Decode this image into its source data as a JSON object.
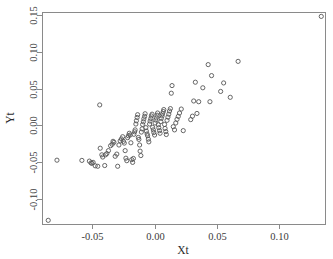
{
  "figure": {
    "width": 333,
    "height": 259,
    "background": "#ffffff",
    "point_color": "#565656",
    "axis_color": "#8a8a8a",
    "text_color": "#3b3b3b"
  },
  "plot_box": {
    "left": 42,
    "right": 325,
    "top": 12,
    "bottom": 224
  },
  "chart_data": {
    "type": "scatter",
    "title": "",
    "xlabel": "Xt",
    "ylabel": "Yt",
    "grid": false,
    "legend": null,
    "marker": "open-circle",
    "xlim": [
      -0.0905,
      0.1365
    ],
    "ylim": [
      -0.1345,
      0.1545
    ],
    "xticks": [
      -0.05,
      0.0,
      0.05,
      0.1
    ],
    "xticklabels": [
      "-0.05",
      "0.00",
      "0.05",
      "0.10"
    ],
    "yticks": [
      -0.1,
      -0.05,
      0.0,
      0.05,
      0.1,
      0.15
    ],
    "yticklabels": [
      "-0.10",
      "-0.05",
      "0.00",
      "0.05",
      "0.10",
      "0.15"
    ],
    "n_points": 124,
    "x": [
      0.1335,
      -0.0855,
      -0.0785,
      -0.0585,
      -0.0525,
      -0.0512,
      -0.0505,
      -0.0495,
      -0.0478,
      -0.0458,
      -0.0442,
      -0.0438,
      -0.0425,
      -0.0418,
      -0.0402,
      -0.0395,
      -0.0385,
      -0.0372,
      -0.0355,
      -0.0342,
      -0.0335,
      -0.0328,
      -0.0318,
      -0.0305,
      -0.0298,
      -0.0288,
      -0.0278,
      -0.0268,
      -0.0258,
      -0.0252,
      -0.0245,
      -0.0238,
      -0.0232,
      -0.0225,
      -0.0218,
      -0.0212,
      -0.0205,
      -0.0198,
      -0.0192,
      -0.0185,
      -0.0178,
      -0.0172,
      -0.0168,
      -0.0162,
      -0.0158,
      -0.0152,
      -0.0148,
      -0.0142,
      -0.0138,
      -0.0132,
      -0.0128,
      -0.0122,
      -0.0118,
      -0.0112,
      -0.0108,
      -0.0102,
      -0.0098,
      -0.0092,
      -0.0088,
      -0.0082,
      -0.0078,
      -0.0072,
      -0.0068,
      -0.0062,
      -0.0058,
      -0.0052,
      -0.0048,
      -0.0042,
      -0.0038,
      -0.0032,
      -0.0028,
      -0.0022,
      -0.0018,
      -0.0012,
      -0.0008,
      -0.0002,
      0.0002,
      0.0008,
      0.0012,
      0.0018,
      0.0022,
      0.0028,
      0.0032,
      0.0038,
      0.0042,
      0.0048,
      0.0052,
      0.0058,
      0.0062,
      0.0068,
      0.0072,
      0.0078,
      0.0082,
      0.0088,
      0.0092,
      0.0098,
      0.0105,
      0.0112,
      0.0118,
      0.0125,
      0.0132,
      0.0138,
      0.0148,
      0.0158,
      0.0168,
      0.0178,
      0.0188,
      0.0198,
      0.0212,
      0.0228,
      0.0288,
      0.0302,
      0.0312,
      0.0325,
      0.0338,
      0.0352,
      0.0385,
      0.0428,
      0.0442,
      0.0455,
      0.0528,
      0.0552,
      0.0605,
      0.0668
    ],
    "y": [
      0.1485,
      -0.1295,
      -0.0475,
      -0.0478,
      -0.0488,
      -0.0512,
      -0.0518,
      -0.0505,
      -0.0552,
      -0.0558,
      0.0278,
      -0.0312,
      -0.0402,
      -0.0432,
      -0.0548,
      -0.0402,
      -0.0385,
      -0.0345,
      -0.0278,
      -0.0258,
      -0.0218,
      -0.0232,
      -0.0422,
      -0.0392,
      -0.0558,
      -0.0268,
      -0.0212,
      -0.0185,
      -0.0155,
      -0.0218,
      -0.0242,
      -0.0345,
      -0.0448,
      -0.0482,
      -0.0168,
      -0.0142,
      -0.0108,
      -0.0132,
      -0.0238,
      -0.0468,
      -0.0505,
      -0.0452,
      -0.0122,
      -0.0088,
      -0.0062,
      0.0018,
      0.0062,
      0.0108,
      0.0145,
      -0.0165,
      -0.0192,
      -0.0268,
      -0.0352,
      -0.0412,
      -0.0092,
      -0.0048,
      0.0012,
      0.0048,
      0.0088,
      0.0122,
      0.0158,
      -0.0032,
      -0.0078,
      -0.0118,
      -0.0142,
      -0.0188,
      -0.0225,
      0.0018,
      0.0058,
      0.0092,
      0.0128,
      0.0152,
      -0.0028,
      -0.0062,
      -0.0098,
      -0.0132,
      0.0032,
      0.0072,
      0.0102,
      0.0138,
      0.0168,
      0.0008,
      -0.0032,
      -0.0072,
      -0.0108,
      0.0052,
      0.0095,
      0.0128,
      0.0158,
      0.0188,
      0.0215,
      0.0012,
      -0.0042,
      -0.0085,
      -0.0125,
      0.0068,
      0.0112,
      0.0152,
      0.0195,
      0.0228,
      0.0438,
      0.0542,
      -0.0018,
      -0.0062,
      0.0032,
      0.0082,
      0.0122,
      0.0168,
      0.0222,
      -0.0072,
      0.0078,
      0.0125,
      0.0332,
      0.0588,
      0.0162,
      0.0322,
      0.0512,
      0.0828,
      0.0322,
      0.0678,
      0.0462,
      0.0578,
      0.0382,
      0.0872
    ]
  }
}
